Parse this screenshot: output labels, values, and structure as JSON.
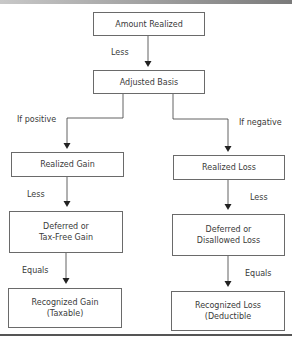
{
  "diagram": {
    "nodes": {
      "amount_realized": "Amount Realized",
      "adjusted_basis": "Adjusted Basis",
      "realized_gain": "Realized Gain",
      "realized_loss": "Realized Loss",
      "deferred_gain_l1": "Deferred or",
      "deferred_gain_l2": "Tax-Free Gain",
      "deferred_loss_l1": "Deferred or",
      "deferred_loss_l2": "Disallowed Loss",
      "recognized_gain_l1": "Recognized Gain",
      "recognized_gain_l2": "(Taxable)",
      "recognized_loss_l1": "Recognized Loss",
      "recognized_loss_l2": "(Deductible"
    },
    "edge_labels": {
      "less_top": "Less",
      "if_positive": "If positive",
      "if_negative": "If negative",
      "less_left": "Less",
      "less_right": "Less",
      "equals_left": "Equals",
      "equals_right": "Equals"
    },
    "colors": {
      "line": "#3a3a3a",
      "box_border": "#6a6a6a",
      "text": "#3a3a3a"
    }
  }
}
